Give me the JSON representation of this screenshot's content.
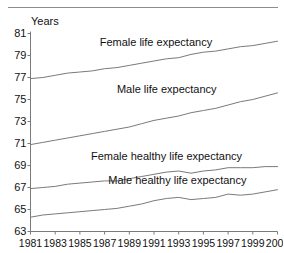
{
  "axis_unit_label": "Years",
  "chart_data": {
    "type": "line",
    "title": "",
    "subtitle": "",
    "xlabel": "",
    "ylabel": "Years",
    "grid": false,
    "legend_position": "inline-annotations",
    "xlim": [
      1981,
      2001
    ],
    "ylim": [
      63,
      81
    ],
    "ytick_step": 2,
    "xtick_step": 2,
    "x": [
      1981,
      1982,
      1983,
      1984,
      1985,
      1986,
      1987,
      1988,
      1989,
      1990,
      1991,
      1992,
      1993,
      1994,
      1995,
      1996,
      1997,
      1998,
      1999,
      2000,
      2001
    ],
    "categories": [
      "1981",
      "1982",
      "1983",
      "1984",
      "1985",
      "1986",
      "1987",
      "1988",
      "1989",
      "1990",
      "1991",
      "1992",
      "1993",
      "1994",
      "1995",
      "1996",
      "1997",
      "1998",
      "1999",
      "2000",
      "2001"
    ],
    "xtick_labels": [
      "1981",
      "1983",
      "1985",
      "1987",
      "1989",
      "1991",
      "1993",
      "1995",
      "1997",
      "1999",
      "2001"
    ],
    "xtick_values": [
      1981,
      1983,
      1985,
      1987,
      1989,
      1991,
      1993,
      1995,
      1997,
      1999,
      2001
    ],
    "ytick_labels": [
      "63",
      "65",
      "67",
      "69",
      "71",
      "73",
      "75",
      "77",
      "79",
      "81"
    ],
    "ytick_values": [
      63,
      65,
      67,
      69,
      71,
      73,
      75,
      77,
      79,
      81
    ],
    "line_color": "#7a7a7a",
    "axis_color": "#7a7a7a",
    "series": [
      {
        "name": "Female life expectancy",
        "label": "Female life expectancy",
        "label_x": 1986.6,
        "label_y": 80.1,
        "values": [
          76.9,
          77.0,
          77.2,
          77.4,
          77.5,
          77.6,
          77.8,
          77.9,
          78.1,
          78.3,
          78.5,
          78.7,
          78.8,
          79.1,
          79.3,
          79.4,
          79.6,
          79.8,
          79.9,
          80.1,
          80.3
        ]
      },
      {
        "name": "Male life expectancy",
        "label": "Male life expectancy",
        "label_x": 1988.0,
        "label_y": 75.9,
        "values": [
          70.9,
          71.1,
          71.3,
          71.5,
          71.7,
          71.9,
          72.1,
          72.3,
          72.5,
          72.8,
          73.1,
          73.3,
          73.5,
          73.8,
          74.0,
          74.2,
          74.5,
          74.8,
          75.0,
          75.3,
          75.6
        ]
      },
      {
        "name": "Female healthy life expectancy",
        "label": "Female healthy life expectancy",
        "label_x": 1985.9,
        "label_y": 69.8,
        "values": [
          66.9,
          67.0,
          67.1,
          67.3,
          67.4,
          67.5,
          67.6,
          67.6,
          67.8,
          68.0,
          68.2,
          68.4,
          68.5,
          68.3,
          68.5,
          68.6,
          68.8,
          68.8,
          68.8,
          68.9,
          68.9
        ]
      },
      {
        "name": "Male healthy life expectancy",
        "label": "Male healthy life expectancy",
        "label_x": 1987.3,
        "label_y": 67.6,
        "values": [
          64.3,
          64.5,
          64.6,
          64.7,
          64.8,
          64.9,
          65.0,
          65.1,
          65.3,
          65.5,
          65.8,
          66.0,
          66.1,
          65.9,
          66.0,
          66.1,
          66.4,
          66.3,
          66.4,
          66.6,
          66.8
        ]
      }
    ]
  }
}
